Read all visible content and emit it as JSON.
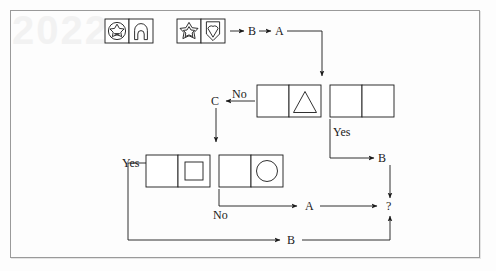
{
  "figure": {
    "type": "flowchart",
    "title": "",
    "background_color": "#fdfdfd",
    "frame_color": "#9a9a9a",
    "stroke_color": "#1a1a1a",
    "watermark_text": "2022"
  },
  "shape_groups": [
    {
      "name": "stimulus-group-left",
      "cells": [
        {
          "name": "cell-circle-star",
          "icon": "circle-with-star-icon"
        },
        {
          "name": "cell-arch",
          "icon": "arch-icon"
        }
      ]
    },
    {
      "name": "stimulus-group-right",
      "cells": [
        {
          "name": "cell-star",
          "icon": "star-icon"
        },
        {
          "name": "cell-heart",
          "icon": "heart-in-frame-icon"
        }
      ]
    },
    {
      "name": "probe-group-triangle",
      "cells": [
        {
          "name": "cell-empty-left",
          "icon": "empty"
        },
        {
          "name": "cell-triangle",
          "icon": "triangle-icon"
        }
      ]
    },
    {
      "name": "probe-group-blank",
      "cells": [
        {
          "name": "cell-empty-left",
          "icon": "empty"
        },
        {
          "name": "cell-empty-right",
          "icon": "empty"
        }
      ]
    },
    {
      "name": "probe-group-square",
      "cells": [
        {
          "name": "cell-empty-left",
          "icon": "empty"
        },
        {
          "name": "cell-square",
          "icon": "square-icon"
        }
      ]
    },
    {
      "name": "probe-group-circle",
      "cells": [
        {
          "name": "cell-empty-left",
          "icon": "empty"
        },
        {
          "name": "cell-circle",
          "icon": "circle-icon"
        }
      ]
    }
  ],
  "labels": {
    "top_b": "B",
    "top_a": "A",
    "no_top": "No",
    "c": "C",
    "yes_right": "Yes",
    "b_right": "B",
    "yes_left": "Yes",
    "no_bottom": "No",
    "a_mid": "A",
    "question": "?",
    "b_bottom": "B"
  }
}
